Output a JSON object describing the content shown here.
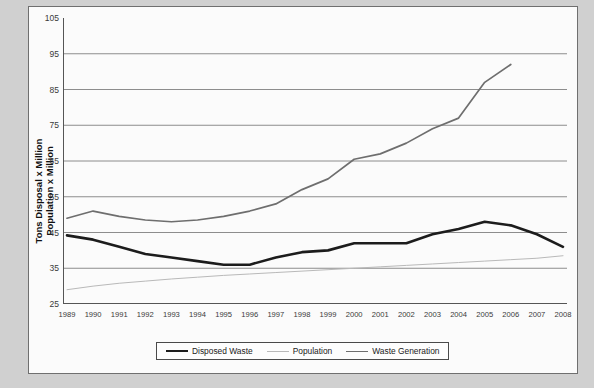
{
  "chart_data": {
    "type": "line",
    "title": "",
    "xlabel": "",
    "ylabel": "Tons Disposal x Million Population x Million",
    "ylabel_line1": "Tons Disposal x Million",
    "ylabel_line2": "Population x Million",
    "ylim": [
      25,
      105
    ],
    "ytick_step": 10,
    "yticks": [
      25,
      35,
      45,
      55,
      65,
      75,
      85,
      95,
      105
    ],
    "grid": "horizontal",
    "legend_position": "bottom-center",
    "x": [
      1989,
      1990,
      1991,
      1992,
      1993,
      1994,
      1995,
      1996,
      1997,
      1998,
      1999,
      2000,
      2001,
      2002,
      2003,
      2004,
      2005,
      2006,
      2007,
      2008
    ],
    "categories": [
      "1989",
      "1990",
      "1991",
      "1992",
      "1993",
      "1994",
      "1995",
      "1996",
      "1997",
      "1998",
      "1999",
      "2000",
      "2001",
      "2002",
      "2003",
      "2004",
      "2005",
      "2006",
      "2007",
      "2008"
    ],
    "series": [
      {
        "name": "Disposed Waste",
        "color": "#1c1c1c",
        "width": 2.6,
        "values": [
          44.2,
          43.0,
          41.0,
          39.0,
          38.0,
          37.0,
          36.0,
          36.0,
          38.0,
          39.5,
          40.0,
          42.0,
          42.0,
          42.0,
          44.5,
          46.0,
          48.0,
          47.0,
          44.5,
          41.0
        ]
      },
      {
        "name": "Population",
        "color": "#b9b9b9",
        "width": 1.0,
        "values": [
          29.0,
          30.0,
          30.8,
          31.4,
          32.0,
          32.5,
          33.0,
          33.4,
          33.8,
          34.2,
          34.6,
          35.0,
          35.4,
          35.8,
          36.2,
          36.6,
          37.0,
          37.4,
          37.8,
          38.5
        ]
      },
      {
        "name": "Waste Generation",
        "color": "#6e6e6e",
        "width": 1.7,
        "values": [
          49.0,
          51.0,
          49.5,
          48.5,
          48.0,
          48.5,
          49.5,
          51.0,
          53.0,
          57.0,
          60.0,
          65.5,
          67.0,
          70.0,
          74.0,
          77.0,
          87.0,
          92.0,
          null,
          null
        ]
      }
    ]
  },
  "legend": {
    "items": [
      {
        "label": "Disposed Waste"
      },
      {
        "label": "Population"
      },
      {
        "label": "Waste Generation"
      }
    ]
  }
}
